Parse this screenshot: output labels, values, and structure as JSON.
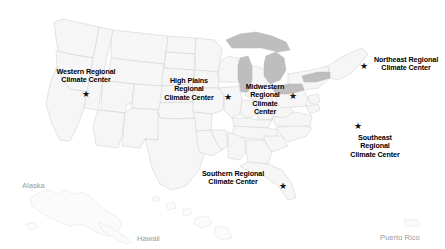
{
  "map": {
    "title": "NOAA Regional Climate Centers Map",
    "background_color": "#ffffff",
    "land_fill": "#f7f7f7",
    "border_color": "#d0d0d0",
    "lakes_fill": "#bdbdbd",
    "label_color": "#000000",
    "inset_label_color": "#9a9a9a",
    "star_glyph": "★"
  },
  "centers": [
    {
      "id": "western",
      "name": "Western Regional Climate Center",
      "lines": [
        "Western Regional",
        "Climate Center"
      ],
      "star": "★"
    },
    {
      "id": "high-plains",
      "name": "High Plains Regional Climate Center",
      "lines": [
        "High Plains",
        "Regional",
        "Climate Center"
      ],
      "star": "★"
    },
    {
      "id": "midwestern",
      "name": "Midwestern Regional Climate Center",
      "lines": [
        "Midwestern",
        "Regional",
        "Climate",
        "Center"
      ],
      "star": "★"
    },
    {
      "id": "northeast",
      "name": "Northeast Regional Climate Center",
      "lines": [
        "Northeast Regional",
        "Climate Center"
      ],
      "star": "★"
    },
    {
      "id": "southeast",
      "name": "Southeast Regional Climate Center",
      "lines": [
        "Southeast",
        "Regional",
        "Climate Center"
      ],
      "star": "★"
    },
    {
      "id": "southern",
      "name": "Southern Regional Climate Center",
      "lines": [
        "Southern Regional",
        "Climate Center"
      ],
      "star": "★"
    }
  ],
  "insets": [
    {
      "id": "alaska",
      "label": "Alaska"
    },
    {
      "id": "hawaii",
      "label": "Hawaii"
    },
    {
      "id": "puerto-rico",
      "label": "Puerto Rico"
    }
  ]
}
